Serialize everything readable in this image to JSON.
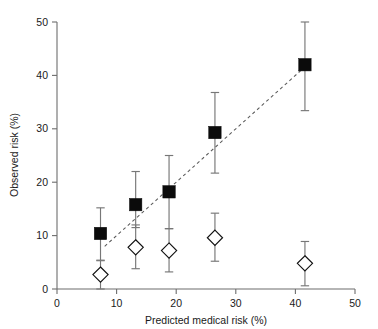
{
  "chart_data": {
    "type": "scatter",
    "title": "",
    "xlabel": "Predicted medical risk (%)",
    "ylabel": "Observed risk (%)",
    "xlim": [
      0,
      50
    ],
    "ylim": [
      0,
      50
    ],
    "xticks": [
      0,
      10,
      20,
      30,
      40,
      50
    ],
    "yticks": [
      0,
      10,
      20,
      30,
      40,
      50
    ],
    "xtick_labels": [
      "0",
      "10",
      "20",
      "30",
      "40",
      "50"
    ],
    "ytick_labels": [
      "0",
      "10",
      "20",
      "30",
      "40",
      "50"
    ],
    "grid": false,
    "legend": "none",
    "series": [
      {
        "name": "Filled squares",
        "marker": "filled-square",
        "x": [
          7.3,
          13.2,
          18.8,
          26.5,
          41.6
        ],
        "y": [
          10.4,
          15.8,
          18.2,
          29.3,
          42.0
        ],
        "y_err_low": [
          5.4,
          11.5,
          11.3,
          21.7,
          33.4
        ],
        "y_err_high": [
          15.2,
          22.0,
          25.0,
          36.8,
          50.0
        ]
      },
      {
        "name": "Open diamonds",
        "marker": "open-diamond",
        "x": [
          7.3,
          13.2,
          18.8,
          26.5,
          41.6
        ],
        "y": [
          2.7,
          7.8,
          7.2,
          9.6,
          4.8
        ],
        "y_err_low": [
          0.0,
          3.8,
          3.2,
          5.2,
          0.6
        ],
        "y_err_high": [
          5.3,
          12.0,
          11.3,
          14.2,
          8.9
        ]
      }
    ],
    "reference_line": {
      "name": "Perfect calibration reference",
      "style": "dashed",
      "x": [
        8.0,
        42.0
      ],
      "y": [
        8.0,
        42.0
      ]
    }
  },
  "colors": {
    "square_fill": "#0b0b0b",
    "diamond_fill": "#ffffff",
    "diamond_stroke": "#111111",
    "error_bar": "#777777",
    "axis": "#6d6d6d",
    "reference_line": "#5a5a5a",
    "background": "#ffffff",
    "text": "#1a1a1a"
  }
}
